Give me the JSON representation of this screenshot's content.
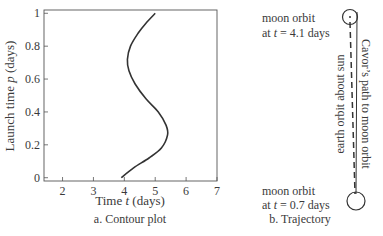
{
  "panel_a": {
    "caption": "a. Contour plot",
    "xlabel_prefix": "Time ",
    "xlabel_var": "t",
    "xlabel_suffix": " (days)",
    "ylabel_prefix": "Launch time ",
    "ylabel_var": "p",
    "ylabel_suffix": " (days)",
    "xticks": [
      "2",
      "3",
      "4",
      "5",
      "6",
      "7"
    ],
    "yticks": [
      "0",
      "0.2",
      "0.4",
      "0.6",
      "0.8",
      "1"
    ]
  },
  "panel_b": {
    "caption": "b. Trajectory",
    "top_label_line1": "moon orbit",
    "top_label_line2_prefix": "at ",
    "top_label_line2_var": "t",
    "top_label_line2_suffix": " = 4.1 days",
    "bottom_label_line1": "moon orbit",
    "bottom_label_line2_prefix": "at ",
    "bottom_label_line2_var": "t",
    "bottom_label_line2_suffix": " = 0.7 days",
    "dashed_label": "earth orbit about sun",
    "solid_label": "Cavor’s path to moon orbit"
  },
  "chart_data": {
    "type": "line",
    "title": "Contour plot",
    "xlabel": "Time t (days)",
    "ylabel": "Launch time p (days)",
    "xlim": [
      1.4,
      7.0
    ],
    "ylim": [
      -0.02,
      1.02
    ],
    "xticks": [
      2,
      3,
      4,
      5,
      6,
      7
    ],
    "yticks": [
      0,
      0.2,
      0.4,
      0.6,
      0.8,
      1
    ],
    "grid": false,
    "series": [
      {
        "name": "contour",
        "points": [
          [
            3.9,
            0.0
          ],
          [
            4.3,
            0.06
          ],
          [
            4.8,
            0.12
          ],
          [
            5.2,
            0.18
          ],
          [
            5.4,
            0.26
          ],
          [
            5.35,
            0.32
          ],
          [
            5.1,
            0.4
          ],
          [
            4.7,
            0.48
          ],
          [
            4.35,
            0.57
          ],
          [
            4.15,
            0.65
          ],
          [
            4.1,
            0.72
          ],
          [
            4.2,
            0.8
          ],
          [
            4.45,
            0.88
          ],
          [
            4.7,
            0.94
          ],
          [
            5.0,
            1.0
          ]
        ]
      }
    ]
  },
  "colors": {
    "ink": "#333333",
    "background": "#ffffff"
  }
}
